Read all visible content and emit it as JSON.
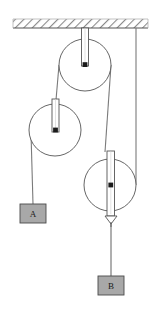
{
  "figure": {
    "name": "pulley-system-diagram",
    "type": "physics-free-body-diagram",
    "width": 157,
    "height": 315,
    "background_color": "#ffffff"
  },
  "ceiling": {
    "name": "ceiling-support",
    "label": "",
    "hatch_pattern": "diagonal",
    "stroke_color": "#555555",
    "hatch_color": "#8a8a8a",
    "x": 13,
    "y": 19,
    "width": 135,
    "height": 9
  },
  "pulleys": [
    {
      "id": "pulley-top",
      "label": "",
      "role": "fixed",
      "cx": 85,
      "cy": 65,
      "r": 26,
      "stroke_color": "#555555",
      "fill_color": "#ffffff",
      "axle_color": "#1a1a1a",
      "hanger": {
        "x": 81,
        "y": 28,
        "width": 7,
        "height": 38,
        "stroke_color": "#555555"
      }
    },
    {
      "id": "pulley-left",
      "label": "",
      "role": "movable",
      "cx": 55,
      "cy": 130,
      "r": 26,
      "stroke_color": "#555555",
      "fill_color": "#ffffff",
      "axle_color": "#1a1a1a",
      "hanger": {
        "x": 52,
        "y": 98,
        "width": 7,
        "height": 34,
        "stroke_color": "#555555"
      }
    },
    {
      "id": "pulley-right",
      "label": "",
      "role": "movable",
      "cx": 110,
      "cy": 185,
      "r": 26,
      "stroke_color": "#555555",
      "fill_color": "#ffffff",
      "axle_color": "#1a1a1a",
      "hanger": {
        "x": 107,
        "y": 150,
        "width": 7,
        "height": 66,
        "stroke_color": "#555555"
      }
    }
  ],
  "ropes": [
    {
      "id": "rope-ceiling-to-right-pulley",
      "from": "ceiling",
      "to": "pulley-right",
      "color": "#7a7a7a"
    },
    {
      "id": "rope-top-left-to-left-pulley",
      "from": "pulley-top",
      "to": "pulley-left",
      "color": "#7a7a7a"
    },
    {
      "id": "rope-top-right-to-right-pulley",
      "from": "pulley-top",
      "to": "pulley-right",
      "color": "#7a7a7a"
    },
    {
      "id": "rope-left-pulley-to-block-a",
      "from": "pulley-left",
      "to": "block-A",
      "color": "#7a7a7a"
    },
    {
      "id": "rope-hook-to-block-b",
      "from": "pulley-right",
      "to": "block-B",
      "color": "#7a7a7a"
    }
  ],
  "hook": {
    "name": "hook-arrow",
    "cx": 110,
    "cy": 220,
    "stroke_color": "#555555"
  },
  "blocks": [
    {
      "id": "block-A",
      "label": "A",
      "x": 20,
      "y": 204,
      "width": 26,
      "height": 19,
      "fill_color": "#a8a8a8",
      "stroke_color": "#4a4a4a",
      "text_color": "#1a1a1a"
    },
    {
      "id": "block-B",
      "label": "B",
      "x": 98,
      "y": 276,
      "width": 26,
      "height": 19,
      "fill_color": "#a8a8a8",
      "stroke_color": "#4a4a4a",
      "text_color": "#1a1a1a"
    }
  ]
}
